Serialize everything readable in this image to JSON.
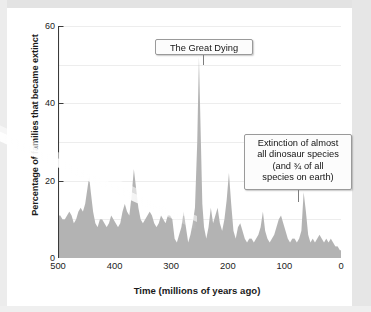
{
  "figure": {
    "background_color": "#ffffff",
    "series_fill_color": "#b3b3b3",
    "axis_color": "#3a3a3a",
    "grid_color": "#ededed"
  },
  "axes": {
    "y_title": "Percentage of families that became extinct",
    "x_title": "Time  (millions of years ago)",
    "y_tick_labels": [
      "60",
      "40",
      "20",
      "0"
    ],
    "x_tick_labels": [
      "500",
      "400",
      "300",
      "200",
      "100",
      "0"
    ]
  },
  "annotations": {
    "great_dying": {
      "text": "The Great Dying"
    },
    "dinosaur": {
      "line1": "Extinction of almost",
      "line2": "all dinosaur species",
      "line3": "(and ¾ of all",
      "line4": "species on earth)"
    }
  },
  "chart_data": {
    "type": "area",
    "title": "",
    "subtitle": "",
    "xlabel": "Time  (millions of years ago)",
    "ylabel": "Percentage of families that became extinct",
    "xlim": [
      500,
      0
    ],
    "ylim": [
      0,
      60
    ],
    "x_ticks": [
      500,
      400,
      300,
      200,
      100,
      0
    ],
    "y_ticks": [
      0,
      20,
      40,
      60
    ],
    "grid": true,
    "grid_interval": 10,
    "x_axis_inverted": true,
    "legend": "none",
    "annotations": [
      {
        "label": "The Great Dying",
        "x": 252,
        "y": 52
      },
      {
        "label": "Extinction of almost all dinosaur species (and ¾ of all species on earth)",
        "x": 65,
        "y": 17
      }
    ],
    "series": [
      {
        "name": "Percentage of families that became extinct",
        "fill": "#b3b3b3",
        "x": [
          500,
          496,
          492,
          488,
          484,
          480,
          476,
          472,
          468,
          464,
          460,
          456,
          452,
          448,
          445,
          442,
          438,
          434,
          430,
          426,
          422,
          418,
          414,
          410,
          406,
          402,
          398,
          394,
          390,
          386,
          382,
          378,
          374,
          370,
          366,
          362,
          358,
          354,
          350,
          346,
          342,
          338,
          334,
          330,
          326,
          322,
          318,
          314,
          310,
          306,
          302,
          298,
          294,
          290,
          286,
          282,
          278,
          274,
          270,
          266,
          262,
          258,
          254,
          251,
          248,
          245,
          242,
          238,
          234,
          230,
          226,
          222,
          218,
          214,
          210,
          206,
          202,
          198,
          194,
          190,
          186,
          182,
          178,
          174,
          170,
          166,
          162,
          158,
          154,
          150,
          146,
          142,
          138,
          134,
          130,
          126,
          122,
          118,
          114,
          110,
          106,
          102,
          98,
          94,
          90,
          86,
          82,
          78,
          74,
          70,
          66,
          62,
          58,
          54,
          50,
          46,
          42,
          38,
          34,
          30,
          26,
          22,
          18,
          14,
          10,
          6,
          2,
          0
        ],
        "values": [
          11,
          11,
          10,
          10,
          11,
          12,
          11,
          9,
          10,
          12,
          13,
          12,
          14,
          18,
          21,
          17,
          12,
          9,
          8,
          10,
          10,
          9,
          8,
          9,
          11,
          10,
          9,
          8,
          9,
          12,
          14,
          12,
          11,
          16,
          23,
          18,
          13,
          10,
          9,
          10,
          11,
          12,
          11,
          9,
          8,
          9,
          11,
          10,
          9,
          11,
          11,
          10,
          5,
          4,
          6,
          8,
          12,
          8,
          4,
          6,
          9,
          13,
          30,
          52,
          33,
          14,
          8,
          5,
          8,
          13,
          9,
          11,
          13,
          9,
          7,
          10,
          15,
          22,
          14,
          7,
          5,
          8,
          9,
          7,
          5,
          4,
          5,
          5,
          4,
          5,
          6,
          8,
          12,
          7,
          5,
          4,
          5,
          6,
          8,
          10,
          11,
          9,
          7,
          5,
          4,
          5,
          5,
          4,
          5,
          7,
          17,
          12,
          6,
          4,
          5,
          4,
          5,
          6,
          5,
          4,
          5,
          4,
          5,
          4,
          3,
          3,
          2,
          2
        ]
      }
    ]
  }
}
